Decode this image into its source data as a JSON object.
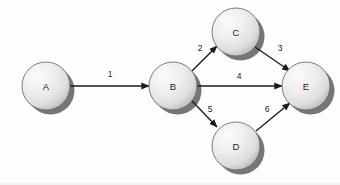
{
  "diagram": {
    "type": "node-link-diagram",
    "canvas": {
      "width": 340,
      "height": 185,
      "background": "#fefefe"
    },
    "style": {
      "node_fill_light": "#f2f2f2",
      "node_fill_dark": "#c6c6c6",
      "node_stroke": "#6e6e6e",
      "node_shadow": "#6a6a6a",
      "edge_color": "#1b1b1b",
      "label_color": "#1a1a1a"
    },
    "nodes": [
      {
        "id": "A",
        "label": "A",
        "cx": 46,
        "cy": 86,
        "r": 24
      },
      {
        "id": "B",
        "label": "B",
        "cx": 173,
        "cy": 86,
        "r": 24
      },
      {
        "id": "C",
        "label": "C",
        "cx": 236,
        "cy": 32,
        "r": 24
      },
      {
        "id": "D",
        "label": "D",
        "cx": 236,
        "cy": 146,
        "r": 24
      },
      {
        "id": "E",
        "label": "E",
        "cx": 306,
        "cy": 86,
        "r": 24
      }
    ],
    "edges": [
      {
        "id": "A-B",
        "from": "A",
        "to": "B",
        "weight": "1",
        "x1": 70,
        "y1": 86,
        "x2": 149,
        "y2": 86,
        "lx": 110,
        "ly": 74
      },
      {
        "id": "B-C",
        "from": "B",
        "to": "C",
        "weight": "2",
        "x1": 192,
        "y1": 71,
        "x2": 217,
        "y2": 46,
        "lx": 200,
        "ly": 48
      },
      {
        "id": "C-E",
        "from": "C",
        "to": "E",
        "weight": "3",
        "x1": 255,
        "y1": 47,
        "x2": 290,
        "y2": 71,
        "lx": 280,
        "ly": 48
      },
      {
        "id": "B-E",
        "from": "B",
        "to": "E",
        "weight": "4",
        "x1": 197,
        "y1": 86,
        "x2": 282,
        "y2": 86,
        "lx": 239,
        "ly": 76
      },
      {
        "id": "B-D",
        "from": "B",
        "to": "D",
        "weight": "5",
        "x1": 192,
        "y1": 101,
        "x2": 217,
        "y2": 127,
        "lx": 210,
        "ly": 109
      },
      {
        "id": "D-E",
        "from": "D",
        "to": "E",
        "weight": "6",
        "x1": 256,
        "y1": 131,
        "x2": 290,
        "y2": 103,
        "lx": 267,
        "ly": 109
      }
    ]
  }
}
